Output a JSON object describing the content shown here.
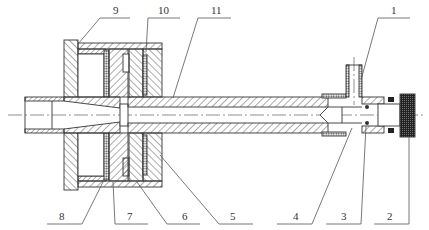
{
  "diagram": {
    "type": "mechanical-cross-section",
    "colors": {
      "line": "#333333",
      "hatch": "#444444",
      "background": "#ffffff",
      "knob_fill": "#222222"
    },
    "part_labels": [
      {
        "id": "1",
        "text": "1",
        "position": "top-right"
      },
      {
        "id": "2",
        "text": "2",
        "position": "bottom"
      },
      {
        "id": "3",
        "text": "3",
        "position": "bottom"
      },
      {
        "id": "4",
        "text": "4",
        "position": "bottom"
      },
      {
        "id": "5",
        "text": "5",
        "position": "bottom"
      },
      {
        "id": "6",
        "text": "6",
        "position": "bottom"
      },
      {
        "id": "7",
        "text": "7",
        "position": "bottom"
      },
      {
        "id": "8",
        "text": "8",
        "position": "bottom"
      },
      {
        "id": "9",
        "text": "9",
        "position": "top"
      },
      {
        "id": "10",
        "text": "10",
        "position": "top"
      },
      {
        "id": "11",
        "text": "11",
        "position": "top"
      }
    ]
  }
}
